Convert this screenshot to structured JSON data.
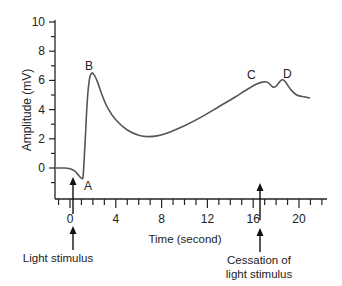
{
  "chart_data": {
    "type": "line",
    "title": "",
    "xlabel": "Time (second)",
    "ylabel": "Amplitude (mV)",
    "xlim": [
      -1,
      22.5
    ],
    "ylim": [
      -2.1,
      10
    ],
    "x_ticks_major": [
      0,
      4,
      8,
      12,
      16,
      20
    ],
    "x_tick_labels": [
      "0",
      "4",
      "8",
      "12",
      "16",
      "20"
    ],
    "x_ticks_minor_step": 1,
    "y_ticks_major": [
      0,
      2,
      4,
      6,
      8,
      10
    ],
    "y_tick_labels": [
      "0",
      "2",
      "4",
      "6",
      "8",
      "10"
    ],
    "y_ticks_minor_step": 1,
    "grid": false,
    "legend": null,
    "series": [
      {
        "name": "ERG response",
        "color": "#555555",
        "x": [
          -1.3,
          -0.5,
          0.0,
          0.4,
          0.8,
          1.0,
          1.15,
          1.3,
          1.5,
          1.7,
          1.9,
          2.1,
          2.4,
          2.8,
          3.3,
          4.0,
          5.0,
          6.0,
          6.8,
          7.6,
          8.5,
          10.0,
          11.5,
          13.0,
          14.5,
          15.5,
          16.3,
          16.9,
          17.3,
          17.7,
          18.0,
          18.3,
          18.6,
          18.9,
          19.3,
          19.8,
          20.3,
          20.9
        ],
        "y": [
          0.0,
          0.0,
          -0.05,
          -0.2,
          -0.55,
          -0.7,
          -0.5,
          1.5,
          4.5,
          6.1,
          6.5,
          6.4,
          5.9,
          5.0,
          4.1,
          3.3,
          2.6,
          2.25,
          2.15,
          2.2,
          2.4,
          2.9,
          3.5,
          4.2,
          4.9,
          5.4,
          5.75,
          5.9,
          5.85,
          5.55,
          5.6,
          5.9,
          6.05,
          5.8,
          5.35,
          5.0,
          4.9,
          4.8
        ]
      }
    ],
    "annotations": [
      {
        "text": "A",
        "x": 1.6,
        "y": -1.5
      },
      {
        "text": "B",
        "x": 1.8,
        "y": 7.1
      },
      {
        "text": "C",
        "x": 16.3,
        "y": 6.5
      },
      {
        "text": "D",
        "x": 19.0,
        "y": 6.7
      }
    ],
    "arrows": [
      {
        "label": "Light stimulus",
        "x": 0.3
      },
      {
        "label": "Cessation of light stimulus",
        "x": 16.6
      }
    ]
  },
  "labels": {
    "ylabel": "Amplitude (mV)",
    "xlabel": "Time (second)",
    "point_a": "A",
    "point_b": "B",
    "point_c": "C",
    "point_d": "D",
    "light_stimulus": "Light stimulus",
    "cessation_line1": "Cessation of",
    "cessation_line2": "light stimulus"
  }
}
